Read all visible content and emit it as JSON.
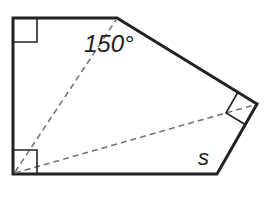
{
  "figure": {
    "type": "pentagon-with-diagonals",
    "colors": {
      "stroke": "#222222",
      "dashed": "#777777",
      "background": "#ffffff"
    },
    "vertices": {
      "top_left": [
        13,
        18
      ],
      "top_apex": [
        117,
        18
      ],
      "right": [
        257,
        104
      ],
      "bottom_right": [
        217,
        174
      ],
      "bottom_left": [
        13,
        174
      ]
    },
    "labels": {
      "angle": "150°",
      "side": "s"
    },
    "right_angles": [
      "top_left",
      "bottom_left",
      "right"
    ],
    "diagonals": [
      {
        "from": "bottom_left",
        "to": "top_apex",
        "style": "dashed"
      },
      {
        "from": "bottom_left",
        "to": "right",
        "style": "dashed"
      }
    ]
  }
}
